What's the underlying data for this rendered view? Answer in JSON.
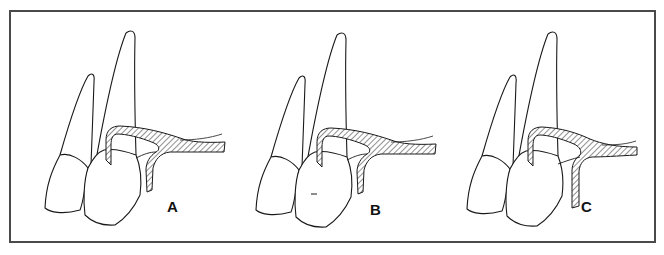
{
  "figure": {
    "panels": [
      {
        "id": "A",
        "label": "A",
        "offset_x": 0
      },
      {
        "id": "B",
        "label": "B",
        "offset_x": 213
      },
      {
        "id": "C",
        "label": "C",
        "offset_x": 421
      }
    ],
    "colors": {
      "line": "#1a1a1a",
      "border": "#4a4a4a",
      "hatch": "#333333",
      "background": "#ffffff"
    }
  }
}
